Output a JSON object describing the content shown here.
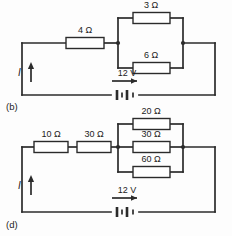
{
  "figure": {
    "type": "electrical-circuit-diagram",
    "background_color": "#fdfdfd",
    "line_color": "#2b2b2b",
    "panels": [
      {
        "id": "b",
        "label": "(b)",
        "current_label": "I",
        "source": {
          "label": "12 V",
          "value": 12,
          "unit": "V",
          "symbol": "battery"
        },
        "series_resistors": [
          {
            "label": "4 Ω",
            "value": 4,
            "unit": "Ω"
          }
        ],
        "parallel_resistors": [
          {
            "label": "3 Ω",
            "value": 3,
            "unit": "Ω"
          },
          {
            "label": "6 Ω",
            "value": 6,
            "unit": "Ω"
          }
        ]
      },
      {
        "id": "d",
        "label": "(d)",
        "current_label": "I",
        "source": {
          "label": "12 V",
          "value": 12,
          "unit": "V",
          "symbol": "battery"
        },
        "series_resistors": [
          {
            "label": "10 Ω",
            "value": 10,
            "unit": "Ω"
          },
          {
            "label": "30 Ω",
            "value": 30,
            "unit": "Ω"
          }
        ],
        "parallel_resistors": [
          {
            "label": "20 Ω",
            "value": 20,
            "unit": "Ω"
          },
          {
            "label": "30 Ω",
            "value": 30,
            "unit": "Ω"
          },
          {
            "label": "60 Ω",
            "value": 60,
            "unit": "Ω"
          }
        ]
      }
    ]
  },
  "panel_b": {
    "panel_label": "(b)",
    "current_label": "I",
    "voltage_label": "12 V",
    "r_series_1": "4 Ω",
    "r_parallel_top": "3 Ω",
    "r_parallel_bottom": "6 Ω"
  },
  "panel_d": {
    "panel_label": "(d)",
    "current_label": "I",
    "voltage_label": "12 V",
    "r_series_1": "10 Ω",
    "r_series_2": "30 Ω",
    "r_parallel_top": "20 Ω",
    "r_parallel_mid": "30 Ω",
    "r_parallel_bottom": "60 Ω"
  }
}
